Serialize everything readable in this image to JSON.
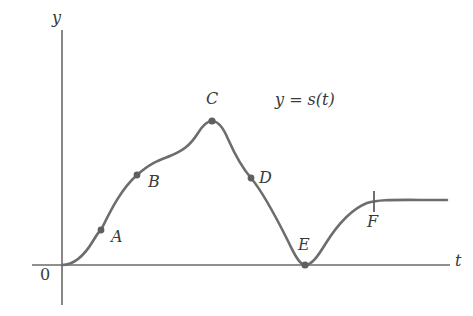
{
  "figure": {
    "background_color": "#ffffff",
    "curve_color": "#6d6d6d",
    "axis_color": "#6a6a6a",
    "text_color": "#3a3a3a",
    "width": 473,
    "height": 316
  },
  "axes": {
    "vertical_label": "y",
    "horizontal_label": "t",
    "origin_label": "0",
    "origin": {
      "x": 62,
      "y": 265
    },
    "y_axis": {
      "x": 62,
      "y_top": 30,
      "y_bottom": 305
    },
    "t_axis": {
      "y": 265,
      "x_left": 32,
      "x_right": 450
    }
  },
  "curve": {
    "equation_label": "y = s(t)",
    "equation_label_position": {
      "x": 275,
      "y": 92
    },
    "path": "M 62,265 C 74,265 84,256 93,241 C 99,231 101,230 101,230 C 109,214 120,190 137,175 C 152,162 160,160 170,156 C 182,151 190,146 198,133 C 203,125 207,121 212,121 C 218,121 223,127 228,139 C 236,157 244,170 251,178 C 262,191 275,215 288,241 C 295,256 300,265 305,265 C 312,265 318,256 326,243 C 338,224 352,209 367,203 C 380,199 392,200 447,200"
  },
  "chart_data": {
    "type": "line",
    "title": "y = s(t)",
    "xlabel": "t",
    "ylabel": "y",
    "grid": false,
    "legend": "none",
    "x": [
      0,
      0.45,
      1.05,
      1.95,
      2.8,
      3.9,
      4.9,
      6.3,
      7.25,
      8.6,
      10.0
    ],
    "y": [
      0,
      0.33,
      0.9,
      1.42,
      1.6,
      2.1,
      1.82,
      1.1,
      0.0,
      0.76,
      0.85
    ],
    "xlim": [
      0,
      10.6
    ],
    "ylim": [
      0,
      2.6
    ],
    "marked_points": [
      {
        "label": "A",
        "type": "dot",
        "note": "inflection point on rising S-curve",
        "x": 1.05,
        "y": 0.9,
        "px": 101,
        "py": 230,
        "label_px": 111,
        "label_py": 229
      },
      {
        "label": "B",
        "type": "dot",
        "note": "point on rising curve",
        "x": 1.95,
        "y": 1.42,
        "px": 137,
        "py": 175,
        "label_px": 148,
        "label_py": 174
      },
      {
        "label": "C",
        "type": "dot",
        "note": "local maximum",
        "x": 3.9,
        "y": 2.1,
        "px": 212,
        "py": 121,
        "label_px": 206,
        "label_py": 91
      },
      {
        "label": "D",
        "type": "dot",
        "note": "inflection point on falling curve",
        "x": 4.9,
        "y": 1.82,
        "px": 251,
        "py": 178,
        "label_px": 259,
        "label_py": 170
      },
      {
        "label": "E",
        "type": "dot",
        "note": "local minimum touching t-axis",
        "x": 7.25,
        "y": 0.0,
        "px": 305,
        "py": 265,
        "label_px": 298,
        "label_py": 237
      },
      {
        "label": "F",
        "type": "tick",
        "note": "point where curve levels off",
        "x": 8.6,
        "y": 0.82,
        "px": 374,
        "py": 201,
        "label_px": 367,
        "label_py": 214
      }
    ]
  }
}
